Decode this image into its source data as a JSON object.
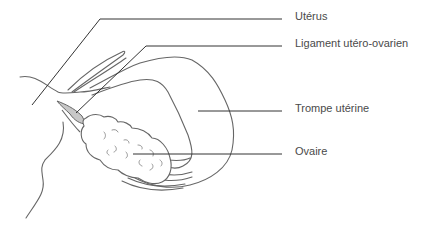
{
  "diagram": {
    "labels": [
      {
        "id": "uterus",
        "text": "Utérus"
      },
      {
        "id": "ligament",
        "text": "Ligament utéro-ovarien"
      },
      {
        "id": "trompe",
        "text": "Trompe utérine"
      },
      {
        "id": "ovaire",
        "text": "Ovaire"
      }
    ],
    "colors": {
      "stroke": "#555555",
      "leader": "#333333",
      "text": "#4a4a4a",
      "ligament_fill": "#c8c8c8",
      "background": "#ffffff"
    }
  }
}
